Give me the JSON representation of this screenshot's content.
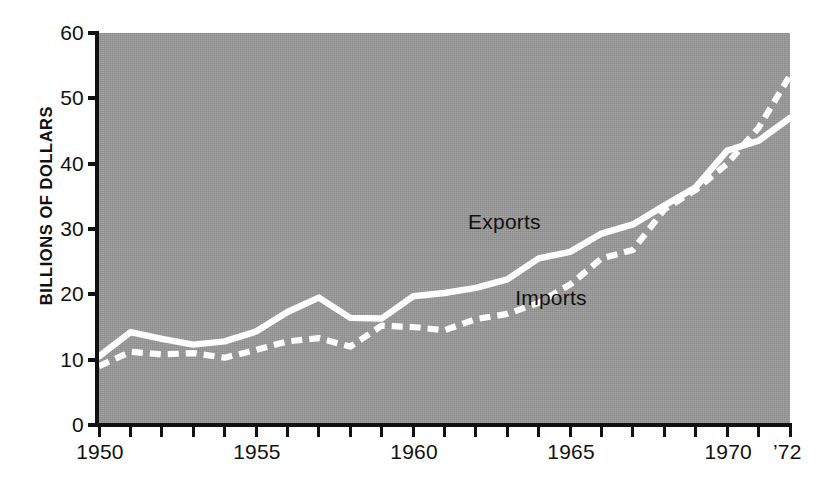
{
  "chart_data": {
    "type": "line",
    "title": "",
    "subtitle": "",
    "xlabel": "",
    "ylabel": "BILLIONS OF DOLLARS",
    "xlim": [
      1950,
      1972
    ],
    "ylim": [
      0,
      60
    ],
    "grid": false,
    "legend_position": "inline-annotation",
    "background_color": "#9a9a9a",
    "series_color": "#fdfdfd",
    "axis_color": "#111111",
    "x": [
      1950,
      1951,
      1952,
      1953,
      1954,
      1955,
      1956,
      1957,
      1958,
      1959,
      1960,
      1961,
      1962,
      1963,
      1964,
      1965,
      1966,
      1967,
      1968,
      1969,
      1970,
      1971,
      1972
    ],
    "series": [
      {
        "name": "Exports",
        "style": "solid",
        "values": [
          10.5,
          14.2,
          13.2,
          12.3,
          12.8,
          14.3,
          17.3,
          19.5,
          16.4,
          16.3,
          19.7,
          20.2,
          21.0,
          22.3,
          25.5,
          26.5,
          29.3,
          30.7,
          33.6,
          36.4,
          42.0,
          43.5,
          47.0
        ]
      },
      {
        "name": "Imports",
        "style": "dashed",
        "values": [
          9.0,
          11.2,
          10.8,
          11.0,
          10.3,
          11.5,
          12.8,
          13.3,
          12.0,
          15.2,
          15.0,
          14.5,
          16.2,
          17.0,
          18.7,
          21.5,
          25.5,
          26.8,
          33.0,
          36.0,
          40.0,
          45.5,
          53.5
        ]
      }
    ],
    "y_ticks": [
      0,
      10,
      20,
      30,
      40,
      50,
      60
    ],
    "y_tick_labels": [
      "0",
      "10",
      "20",
      "30",
      "40",
      "50",
      "60"
    ],
    "x_ticks": [
      1950,
      1951,
      1952,
      1953,
      1954,
      1955,
      1956,
      1957,
      1958,
      1959,
      1960,
      1961,
      1962,
      1963,
      1964,
      1965,
      1966,
      1967,
      1968,
      1969,
      1970,
      1971,
      1972
    ],
    "x_tick_labels": [
      {
        "value": 1950,
        "label": "1950"
      },
      {
        "value": 1955,
        "label": "1955"
      },
      {
        "value": 1960,
        "label": "1960"
      },
      {
        "value": 1965,
        "label": "1965"
      },
      {
        "value": 1970,
        "label": "1970"
      },
      {
        "value": 1972,
        "label": "’72"
      }
    ],
    "annotations": [
      {
        "text": "Exports",
        "x": 1963.0,
        "y": 31.0
      },
      {
        "text": "Imports",
        "x": 1964.5,
        "y": 19.5
      }
    ]
  }
}
